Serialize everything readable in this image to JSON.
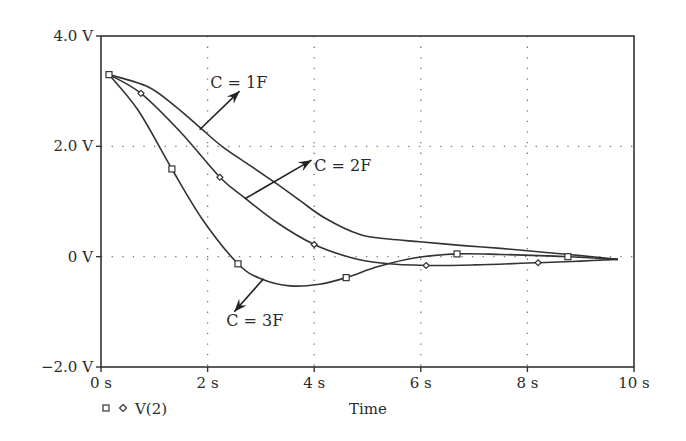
{
  "chart_data": {
    "type": "line",
    "title": "",
    "xlabel": "Time",
    "ylabel": "",
    "xlim": [
      0,
      10
    ],
    "ylim": [
      -2.0,
      4.0
    ],
    "grid": "dotted at x=2,4,6,8 s and y=0,2.0 V",
    "x_ticks": [
      {
        "value": 0,
        "label": "0 s"
      },
      {
        "value": 2,
        "label": "2 s"
      },
      {
        "value": 4,
        "label": "4 s"
      },
      {
        "value": 6,
        "label": "6 s"
      },
      {
        "value": 8,
        "label": "8 s"
      },
      {
        "value": 10,
        "label": "10 s"
      }
    ],
    "y_ticks": [
      {
        "value": 4.0,
        "label": "4.0 V"
      },
      {
        "value": 2.0,
        "label": "2.0 V"
      },
      {
        "value": 0,
        "label": "0 V"
      },
      {
        "value": -2.0,
        "label": "−2.0 V"
      }
    ],
    "legend": {
      "position": "bottom-left",
      "entries": [
        {
          "markers": [
            "square",
            "diamond"
          ],
          "label": "V(2)"
        }
      ]
    },
    "series": [
      {
        "name": "C = 1F",
        "marker": "none",
        "x": [
          0.15,
          0.88,
          1.4,
          1.86,
          2.27,
          2.8,
          3.3,
          3.73,
          4.2,
          4.86,
          5.4,
          5.98,
          6.8,
          7.5,
          8.3,
          9.0,
          9.7
        ],
        "y": [
          3.3,
          3.08,
          2.72,
          2.34,
          2.0,
          1.65,
          1.32,
          1.02,
          0.7,
          0.4,
          0.32,
          0.27,
          0.2,
          0.15,
          0.08,
          0.02,
          -0.05
        ]
      },
      {
        "name": "C = 2F",
        "marker": "diamond",
        "x": [
          0.15,
          0.75,
          1.5,
          2.23,
          2.68,
          3.3,
          4.0,
          4.7,
          5.3,
          6.1,
          7.0,
          8.2,
          9.0,
          9.7
        ],
        "y": [
          3.3,
          2.96,
          2.25,
          1.44,
          1.08,
          0.62,
          0.22,
          -0.02,
          -0.12,
          -0.16,
          -0.15,
          -0.11,
          -0.08,
          -0.05
        ],
        "marker_points": [
          [
            0.75,
            2.96
          ],
          [
            2.23,
            1.44
          ],
          [
            4.0,
            0.22
          ],
          [
            6.1,
            -0.16
          ],
          [
            8.2,
            -0.11
          ]
        ]
      },
      {
        "name": "C = 3F",
        "marker": "square",
        "x": [
          0.15,
          0.7,
          1.33,
          1.9,
          2.57,
          3.0,
          3.55,
          4.1,
          4.6,
          5.2,
          5.9,
          6.68,
          7.5,
          8.76,
          9.7
        ],
        "y": [
          3.3,
          2.65,
          1.59,
          0.68,
          -0.13,
          -0.4,
          -0.53,
          -0.5,
          -0.38,
          -0.18,
          -0.02,
          0.05,
          0.04,
          0.0,
          -0.05
        ],
        "marker_points": [
          [
            0.15,
            3.3
          ],
          [
            1.33,
            1.59
          ],
          [
            2.57,
            -0.13
          ],
          [
            4.6,
            -0.38
          ],
          [
            6.68,
            0.05
          ],
          [
            8.76,
            0.0
          ]
        ]
      }
    ],
    "annotations": [
      {
        "text": "C = 1F",
        "text_at": [
          2.05,
          3.05
        ],
        "arrow_from": [
          1.85,
          2.3
        ],
        "arrow_to": [
          2.6,
          3.0
        ]
      },
      {
        "text": "C = 2F",
        "text_at": [
          4.0,
          1.55
        ],
        "arrow_from": [
          2.7,
          1.05
        ],
        "arrow_to": [
          3.95,
          1.75
        ]
      },
      {
        "text": "C = 3F",
        "text_at": [
          2.35,
          -1.25
        ],
        "arrow_from": [
          3.05,
          -0.4
        ],
        "arrow_to": [
          2.5,
          -1.0
        ]
      }
    ]
  }
}
